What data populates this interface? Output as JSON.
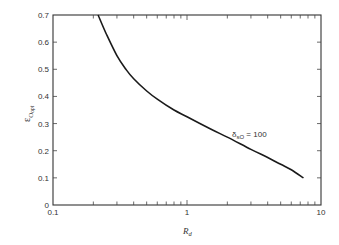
{
  "chart_data": {
    "type": "line",
    "title": "",
    "xlabel": "R_d",
    "ylabel": "ε_O_opt",
    "xscale": "log",
    "xlim": [
      0.1,
      10
    ],
    "ylim": [
      0,
      0.7
    ],
    "grid": false,
    "x_tick_labels": [
      "0.1",
      "1",
      "10"
    ],
    "y_tick_labels": [
      "0",
      "0.1",
      "0.2",
      "0.3",
      "0.4",
      "0.5",
      "0.6",
      "0.7"
    ],
    "series": [
      {
        "name": "δ_sO = 100",
        "x": [
          0.217,
          0.25,
          0.3,
          0.35,
          0.4,
          0.5,
          0.6,
          0.8,
          1.0,
          1.5,
          2.0,
          3.0,
          4.0,
          5.0,
          6.0,
          7.4
        ],
        "y": [
          0.7,
          0.63,
          0.55,
          0.5,
          0.465,
          0.42,
          0.39,
          0.35,
          0.325,
          0.28,
          0.25,
          0.205,
          0.175,
          0.15,
          0.13,
          0.1
        ]
      }
    ],
    "annotations": [
      {
        "text": "δsO = 100",
        "x": 1.6,
        "y": 0.3
      }
    ]
  },
  "labels": {
    "xlabel_main": "R",
    "xlabel_sub": "d",
    "ylabel_main": "ε",
    "ylabel_sub": "O",
    "ylabel_subsub": "opt",
    "anno_main": "δ",
    "anno_sub": "sO",
    "anno_value": " = 100"
  }
}
